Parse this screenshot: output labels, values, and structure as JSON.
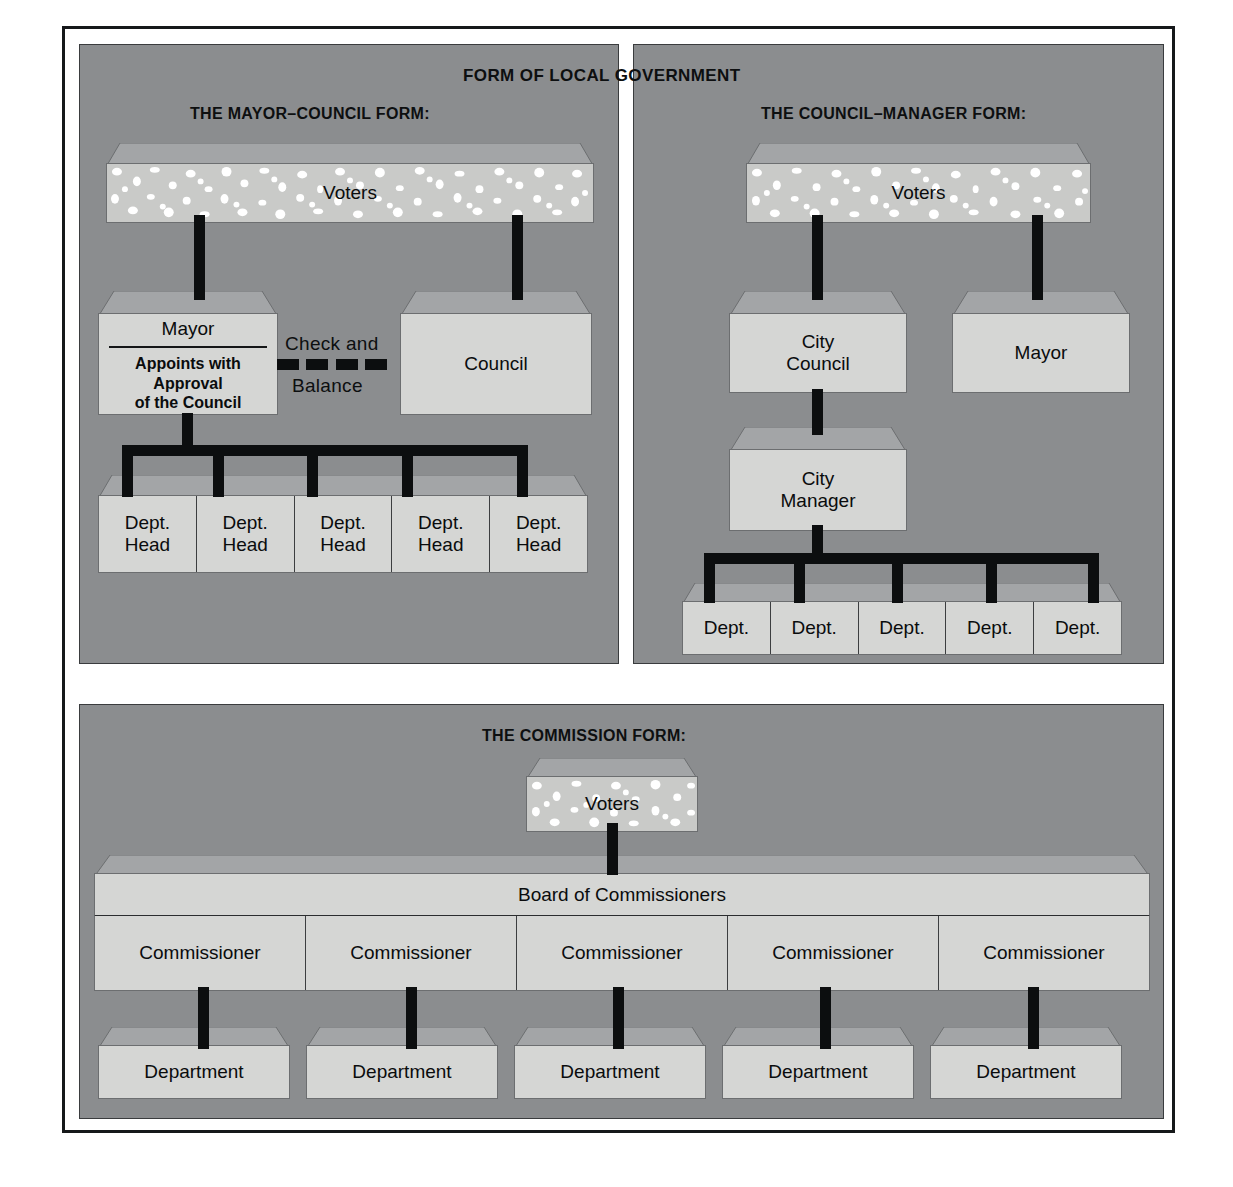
{
  "figure": {
    "main_title": "FORM OF LOCAL   GOVERNMENT",
    "background_color": "#8b8d8f",
    "box_face_color": "#d5d6d4",
    "box_lid_color": "#a3a5a7",
    "connector_color": "#0c0e0f",
    "frame_color": "#16181a"
  },
  "panels": {
    "mayor_council": {
      "title": "THE MAYOR–COUNCIL FORM:",
      "voters": "Voters",
      "mayor_title": "Mayor",
      "mayor_note": "Appoints with\nApproval\nof the Council",
      "check_balance_top": "Check and",
      "check_balance_bottom": "Balance",
      "council": "Council",
      "dept_heads": [
        "Dept.\nHead",
        "Dept.\nHead",
        "Dept.\nHead",
        "Dept.\nHead",
        "Dept.\nHead"
      ]
    },
    "council_manager": {
      "title": "THE COUNCIL–MANAGER FORM:",
      "voters": "Voters",
      "city_council": "City\nCouncil",
      "mayor": "Mayor",
      "city_manager": "City\nManager",
      "departments": [
        "Dept.",
        "Dept.",
        "Dept.",
        "Dept.",
        "Dept."
      ]
    },
    "commission": {
      "title": "THE COMMISSION FORM:",
      "voters": "Voters",
      "board": "Board of Commissioners",
      "commissioners": [
        "Commissioner",
        "Commissioner",
        "Commissioner",
        "Commissioner",
        "Commissioner"
      ],
      "departments": [
        "Department",
        "Department",
        "Department",
        "Department",
        "Department"
      ]
    }
  }
}
